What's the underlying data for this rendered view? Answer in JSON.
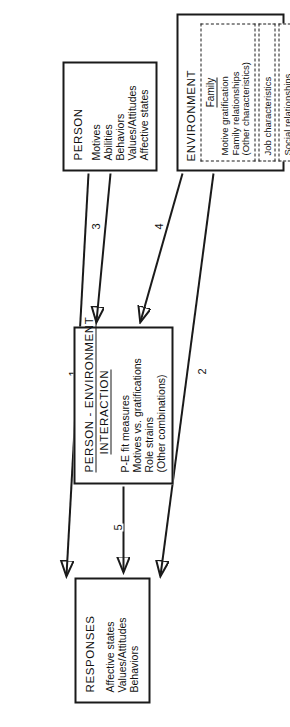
{
  "figure": {
    "caption_faint": "",
    "orientation": "rotated-90-ccw"
  },
  "boxes": {
    "responses": {
      "title": "RESPONSES",
      "items": [
        "Affective states",
        "Values/Attitudes",
        "Behaviors"
      ]
    },
    "person_environment": {
      "title_line1": "PERSON - ENVIRONMENT",
      "title_line2": "INTERACTION",
      "items": [
        "P-E fit measures",
        "Motives vs. gratifications",
        "Role strains",
        "(Other combinations)"
      ]
    },
    "person": {
      "title": "PERSON",
      "items": [
        "Motives",
        "Abilities",
        "Behaviors",
        "Values/Attitudes",
        "Affective states"
      ]
    },
    "environment": {
      "title": "ENVIRONMENT",
      "family": {
        "subtitle": "Family",
        "items": [
          "Motive gratification",
          "Family relationships",
          "(Other characteristics)"
        ]
      },
      "job": "Job characteristics",
      "social": "Social relationships"
    }
  },
  "arrows": {
    "a1": "1",
    "a2": "2",
    "a3": "3",
    "a4": "4",
    "a5": "5"
  },
  "colors": {
    "ink": "#1a1a1a",
    "paper": "#ffffff"
  }
}
